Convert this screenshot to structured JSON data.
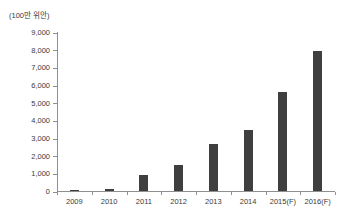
{
  "chart_data": {
    "type": "bar",
    "title": "",
    "unit_label": "(100만 위안)",
    "categories": [
      "2009",
      "2010",
      "2011",
      "2012",
      "2013",
      "2014",
      "2015(F)",
      "2016(F)"
    ],
    "values": [
      40,
      130,
      880,
      1500,
      2640,
      3450,
      5600,
      7900
    ],
    "xlabel": "",
    "ylabel": "",
    "ylim": [
      0,
      9000
    ],
    "ytick_step": 1000,
    "ytick_labels": [
      "0",
      "1,000",
      "2,000",
      "3,000",
      "4,000",
      "5,000",
      "6,000",
      "7,000",
      "8,000",
      "9,000"
    ],
    "grid": false,
    "legend": "none",
    "bar_color": "#3f3f3f",
    "axis_color": "#8f8f8f",
    "label_color": "#3a3a3a",
    "background_color": "#ffffff"
  }
}
